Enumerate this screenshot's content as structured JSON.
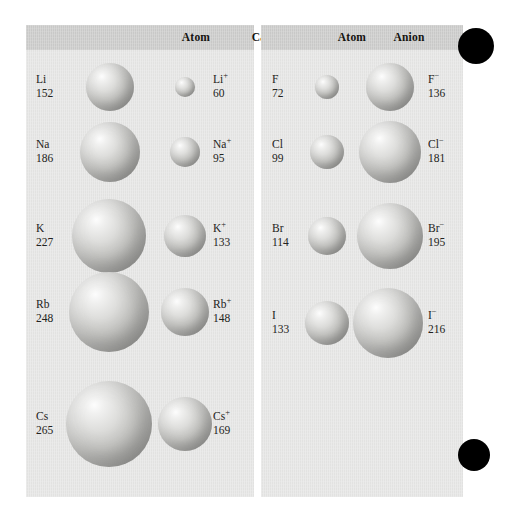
{
  "figure": {
    "background_color": "#ffffff",
    "panel_color": "#e7e7e6",
    "header_color": "#cdcdcc",
    "sphere_color": "#b9b9b7",
    "marker_color": "#000000"
  },
  "left_panel": {
    "headers": [
      {
        "label": "Atom",
        "x": 130,
        "width": 80
      },
      {
        "label": "Cation",
        "x": 203,
        "width": 80
      }
    ],
    "rows": [
      {
        "atom_symbol": "Li",
        "atom_value": "152",
        "ion_symbol": "Li",
        "ion_charge": "+",
        "ion_value": "60",
        "atom_radius_px": 24,
        "ion_radius_px": 10,
        "center_y": 87,
        "atom_cx": 110,
        "ion_cx": 185,
        "label_x": 36,
        "ion_label_x": 213
      },
      {
        "atom_symbol": "Na",
        "atom_value": "186",
        "ion_symbol": "Na",
        "ion_charge": "+",
        "ion_value": "95",
        "atom_radius_px": 30,
        "ion_radius_px": 15,
        "center_y": 152,
        "atom_cx": 110,
        "ion_cx": 185,
        "label_x": 36,
        "ion_label_x": 213
      },
      {
        "atom_symbol": "K",
        "atom_value": "227",
        "ion_symbol": "K",
        "ion_charge": "+",
        "ion_value": "133",
        "atom_radius_px": 37,
        "ion_radius_px": 21,
        "center_y": 236,
        "atom_cx": 109,
        "ion_cx": 185,
        "label_x": 36,
        "ion_label_x": 213
      },
      {
        "atom_symbol": "Rb",
        "atom_value": "248",
        "ion_symbol": "Rb",
        "ion_charge": "+",
        "ion_value": "148",
        "atom_radius_px": 40,
        "ion_radius_px": 24,
        "center_y": 312,
        "atom_cx": 109,
        "ion_cx": 185,
        "label_x": 36,
        "ion_label_x": 213
      },
      {
        "atom_symbol": "Cs",
        "atom_value": "265",
        "ion_symbol": "Cs",
        "ion_charge": "+",
        "ion_value": "169",
        "atom_radius_px": 43,
        "ion_radius_px": 27,
        "center_y": 424,
        "atom_cx": 109,
        "ion_cx": 185,
        "label_x": 36,
        "ion_label_x": 213
      }
    ]
  },
  "right_panel": {
    "headers": [
      {
        "label": "Atom",
        "x": 55,
        "width": 72
      },
      {
        "label": "Anion",
        "x": 112,
        "width": 72
      }
    ],
    "rows": [
      {
        "atom_symbol": "F",
        "atom_value": "72",
        "ion_symbol": "F",
        "ion_charge": "−",
        "ion_value": "136",
        "atom_radius_px": 12,
        "ion_radius_px": 24,
        "center_y": 87,
        "atom_cx": 327,
        "ion_cx": 390,
        "label_x": 272,
        "ion_label_x": 428
      },
      {
        "atom_symbol": "Cl",
        "atom_value": "99",
        "ion_symbol": "Cl",
        "ion_charge": "−",
        "ion_value": "181",
        "atom_radius_px": 17,
        "ion_radius_px": 31,
        "center_y": 152,
        "atom_cx": 327,
        "ion_cx": 390,
        "label_x": 272,
        "ion_label_x": 428
      },
      {
        "atom_symbol": "Br",
        "atom_value": "114",
        "ion_symbol": "Br",
        "ion_charge": "−",
        "ion_value": "195",
        "atom_radius_px": 19,
        "ion_radius_px": 33,
        "center_y": 236,
        "atom_cx": 327,
        "ion_cx": 390,
        "label_x": 272,
        "ion_label_x": 428
      },
      {
        "atom_symbol": "I",
        "atom_value": "133",
        "ion_symbol": "I",
        "ion_charge": "−",
        "ion_value": "216",
        "atom_radius_px": 22,
        "ion_radius_px": 35,
        "center_y": 323,
        "atom_cx": 327,
        "ion_cx": 388,
        "label_x": 272,
        "ion_label_x": 428
      }
    ]
  },
  "markers": [
    {
      "name": "top-right-dot",
      "cx": 476,
      "cy": 46,
      "r": 18
    },
    {
      "name": "bottom-right-dot",
      "cx": 474,
      "cy": 455,
      "r": 16
    }
  ],
  "chart_data": {
    "type": "table",
    "xlabel": "",
    "ylabel": "",
    "columns": [
      "Atom",
      "Atomic radius (pm)",
      "Ion",
      "Ionic radius (pm)"
    ],
    "groups": [
      {
        "name": "Group 1 metals (cations)",
        "rows": [
          {
            "atom": "Li",
            "atom_radius": 152,
            "ion": "Li+",
            "ion_radius": 60
          },
          {
            "atom": "Na",
            "atom_radius": 186,
            "ion": "Na+",
            "ion_radius": 95
          },
          {
            "atom": "K",
            "atom_radius": 227,
            "ion": "K+",
            "ion_radius": 133
          },
          {
            "atom": "Rb",
            "atom_radius": 248,
            "ion": "Rb+",
            "ion_radius": 148
          },
          {
            "atom": "Cs",
            "atom_radius": 265,
            "ion": "Cs+",
            "ion_radius": 169
          }
        ]
      },
      {
        "name": "Group 17 halogens (anions)",
        "rows": [
          {
            "atom": "F",
            "atom_radius": 72,
            "ion": "F-",
            "ion_radius": 136
          },
          {
            "atom": "Cl",
            "atom_radius": 99,
            "ion": "Cl-",
            "ion_radius": 181
          },
          {
            "atom": "Br",
            "atom_radius": 114,
            "ion": "Br-",
            "ion_radius": 195
          },
          {
            "atom": "I",
            "atom_radius": 133,
            "ion": "I-",
            "ion_radius": 216
          }
        ]
      }
    ]
  }
}
